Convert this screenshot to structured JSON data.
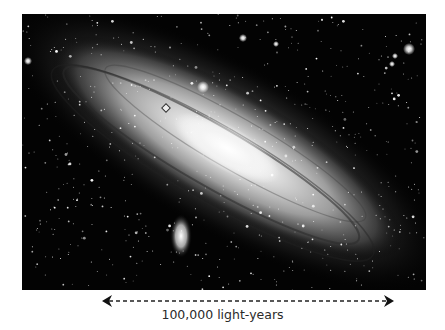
{
  "image": {
    "subject": "Andromeda Galaxy (M31) with satellite galaxy",
    "caption_scale": "100,000 light-years"
  },
  "scale_bar": {
    "label": "100,000 light-years",
    "style": "dashed double-headed arrow"
  },
  "colors": {
    "background": "#ffffff",
    "sky": "#030303",
    "label_text": "#2a2a2a"
  }
}
